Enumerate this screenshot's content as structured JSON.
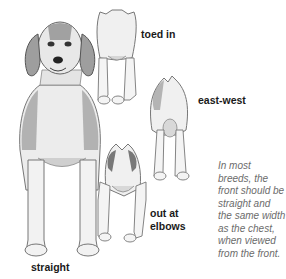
{
  "figure": {
    "labels": {
      "toed_in": "toed in",
      "east_west": "east-west",
      "out_at_elbows_line1": "out at",
      "out_at_elbows_line2": "elbows",
      "straight": "straight"
    },
    "caption": "In most breeds, the front should be straight and the same width as the chest, when viewed from the front.",
    "colors": {
      "background": "#ffffff",
      "label_text": "#1a1a1a",
      "caption_text": "#6b6b6b",
      "drawing_dark": "#555555",
      "drawing_mid": "#9a9a9a",
      "drawing_light": "#e6e6e6"
    }
  }
}
